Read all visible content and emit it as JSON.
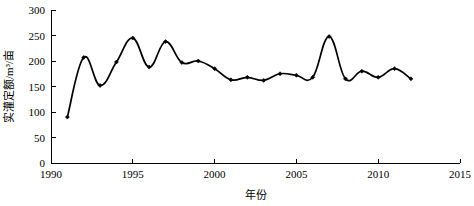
{
  "chart_data": {
    "type": "line",
    "title": "",
    "xlabel": "年份",
    "ylabel": "实灌定额/m³/亩",
    "xlim": [
      1990,
      2015
    ],
    "ylim": [
      0,
      300
    ],
    "xticks": [
      1990,
      1995,
      2000,
      2005,
      2010,
      2015
    ],
    "xtick_labels": [
      "1990",
      "1995",
      "2000",
      "2005",
      "2010",
      "2015"
    ],
    "yticks": [
      0,
      50,
      100,
      150,
      200,
      250,
      300
    ],
    "ytick_labels": [
      "0",
      "50",
      "100",
      "150",
      "200",
      "250",
      "300"
    ],
    "grid": false,
    "legend": "none",
    "marker": "diamond",
    "line_color": "#000000",
    "x": [
      1991,
      1992,
      1993,
      1994,
      1995,
      1996,
      1997,
      1998,
      1999,
      2000,
      2001,
      2002,
      2003,
      2004,
      2005,
      2006,
      2007,
      2008,
      2009,
      2010,
      2011,
      2012
    ],
    "values": [
      90,
      207,
      152,
      198,
      245,
      188,
      238,
      197,
      200,
      185,
      163,
      168,
      162,
      175,
      172,
      168,
      248,
      165,
      180,
      168,
      185,
      165
    ],
    "series": [
      {
        "name": "实灌定额",
        "values": [
          90,
          207,
          152,
          198,
          245,
          188,
          238,
          197,
          200,
          185,
          163,
          168,
          162,
          175,
          172,
          168,
          248,
          165,
          180,
          168,
          185,
          165
        ]
      }
    ]
  },
  "axis": {
    "y_label_text": "实灌定额/m³/亩",
    "x_label_text": "年份"
  }
}
